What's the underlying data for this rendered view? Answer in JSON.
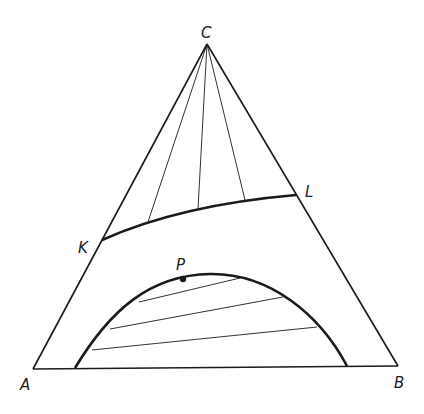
{
  "diagram": {
    "type": "ternary-phase-diagram",
    "vertices": {
      "A": {
        "label": "A",
        "x": 33,
        "y": 369,
        "label_x": 20,
        "label_y": 390
      },
      "B": {
        "label": "B",
        "x": 398,
        "y": 366,
        "label_x": 394,
        "label_y": 388
      },
      "C": {
        "label": "C",
        "x": 207,
        "y": 44,
        "label_x": 201,
        "label_y": 38
      }
    },
    "curve_KL": {
      "K": {
        "label": "K",
        "x": 102,
        "y": 240,
        "label_x": 78,
        "label_y": 253
      },
      "L": {
        "label": "L",
        "x": 296,
        "y": 195,
        "label_x": 305,
        "label_y": 197
      }
    },
    "fan_tie_lines_from_C": [
      {
        "x": 148,
        "y": 222
      },
      {
        "x": 198,
        "y": 209
      },
      {
        "x": 245,
        "y": 200
      }
    ],
    "binodal": {
      "left_base": {
        "x": 75,
        "y": 368
      },
      "right_base": {
        "x": 347,
        "y": 366
      },
      "plait_point": {
        "label": "P",
        "x": 183,
        "y": 279,
        "label_x": 176,
        "label_y": 270
      }
    },
    "binodal_tie_lines": [
      {
        "x1": 139,
        "y1": 302,
        "x2": 240,
        "y2": 278
      },
      {
        "x1": 110,
        "y1": 329,
        "x2": 283,
        "y2": 297
      },
      {
        "x1": 92,
        "y1": 350,
        "x2": 317,
        "y2": 327
      }
    ],
    "colors": {
      "line": "#1a1a1a",
      "background": "#ffffff"
    }
  }
}
